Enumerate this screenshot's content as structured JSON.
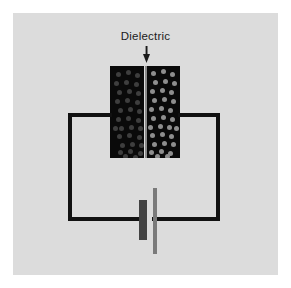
{
  "figure": {
    "title": "Dielectric",
    "type": "parallel-plate-capacitor-with-dielectric-circuit",
    "background_color": "#ffffff",
    "panel_color": "#dcdcdc"
  },
  "annotation": {
    "label": "Dielectric",
    "arrow": "down-arrow",
    "arrow_color": "#1b1b1b",
    "text_color": "#1b1b1b"
  },
  "capacitor": {
    "plate_color": "#0a0a0a",
    "dielectric_color": "#8b8b8b",
    "left_plate": {
      "name": "negative-plate",
      "charge_color": "#3e3e3e",
      "charge_count": 33
    },
    "right_plate": {
      "name": "positive-plate",
      "charge_color": "#8e8e8e",
      "charge_count": 33
    }
  },
  "circuit": {
    "wire_color": "#111111",
    "battery": {
      "negative_terminal_color": "#434343",
      "positive_terminal_color": "#7a7a7a"
    }
  },
  "charges": {
    "left": [
      [
        6,
        6
      ],
      [
        16,
        4
      ],
      [
        25,
        7
      ],
      [
        4,
        15
      ],
      [
        14,
        14
      ],
      [
        24,
        16
      ],
      [
        7,
        24
      ],
      [
        17,
        23
      ],
      [
        26,
        25
      ],
      [
        5,
        33
      ],
      [
        15,
        32
      ],
      [
        25,
        34
      ],
      [
        8,
        42
      ],
      [
        18,
        41
      ],
      [
        27,
        43
      ],
      [
        6,
        51
      ],
      [
        16,
        50
      ],
      [
        26,
        52
      ],
      [
        9,
        60
      ],
      [
        19,
        59
      ],
      [
        28,
        60
      ],
      [
        7,
        68
      ],
      [
        17,
        67
      ],
      [
        27,
        69
      ],
      [
        10,
        77
      ],
      [
        20,
        76
      ],
      [
        29,
        77
      ],
      [
        8,
        84
      ],
      [
        18,
        83
      ],
      [
        28,
        85
      ],
      [
        13,
        88
      ],
      [
        23,
        89
      ],
      [
        3,
        60
      ]
    ],
    "right": [
      [
        4,
        5
      ],
      [
        14,
        3
      ],
      [
        23,
        6
      ],
      [
        6,
        14
      ],
      [
        16,
        13
      ],
      [
        25,
        15
      ],
      [
        3,
        23
      ],
      [
        13,
        22
      ],
      [
        22,
        24
      ],
      [
        5,
        32
      ],
      [
        15,
        31
      ],
      [
        24,
        33
      ],
      [
        2,
        41
      ],
      [
        12,
        40
      ],
      [
        21,
        42
      ],
      [
        4,
        50
      ],
      [
        14,
        49
      ],
      [
        23,
        51
      ],
      [
        1,
        59
      ],
      [
        11,
        58
      ],
      [
        20,
        59
      ],
      [
        3,
        67
      ],
      [
        13,
        66
      ],
      [
        22,
        68
      ],
      [
        5,
        76
      ],
      [
        15,
        75
      ],
      [
        24,
        76
      ],
      [
        2,
        84
      ],
      [
        12,
        83
      ],
      [
        21,
        85
      ],
      [
        8,
        88
      ],
      [
        18,
        88
      ],
      [
        27,
        60
      ]
    ]
  }
}
